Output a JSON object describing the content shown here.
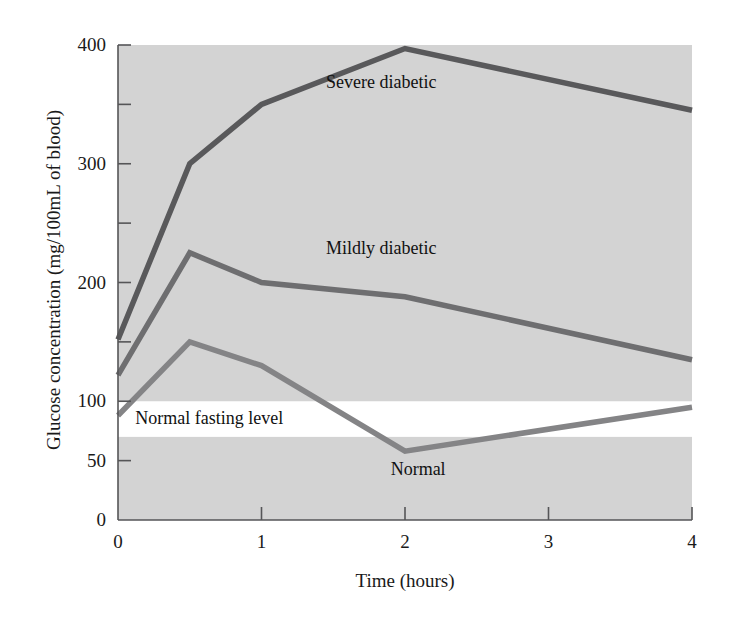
{
  "chart_data": {
    "type": "line",
    "title": "",
    "subtitle": "",
    "xlabel": "Time (hours)",
    "ylabel": "Glucose concentration (mg/100mL of blood)",
    "xlim": [
      0,
      4
    ],
    "ylim": [
      0,
      400
    ],
    "grid": false,
    "legend_position": "inline-annotations",
    "x_ticks": [
      0,
      1,
      2,
      3,
      4
    ],
    "x_tick_labels": [
      "0",
      "1",
      "2",
      "3",
      "4"
    ],
    "y_ticks": [
      0,
      50,
      100,
      150,
      200,
      250,
      300,
      350,
      400
    ],
    "y_tick_labels": [
      "0",
      "50",
      "100",
      "",
      "200",
      "",
      "300",
      "",
      "400"
    ],
    "y_major_labeled": [
      "0",
      "50",
      "100",
      "200",
      "300",
      "400"
    ],
    "series": [
      {
        "name": "Severe diabetic",
        "color": "#59595b",
        "x": [
          0,
          0.5,
          1,
          2,
          4
        ],
        "values": [
          152,
          300,
          350,
          397,
          345
        ],
        "label_x": 1.45,
        "label_y": 368
      },
      {
        "name": "Mildly diabetic",
        "color": "#6e6e70",
        "x": [
          0,
          0.5,
          1,
          2,
          4
        ],
        "values": [
          122,
          225,
          200,
          188,
          135
        ],
        "label_x": 1.45,
        "label_y": 228
      },
      {
        "name": "Normal",
        "color": "#848486",
        "x": [
          0,
          0.5,
          1,
          2,
          4
        ],
        "values": [
          88,
          150,
          130,
          58,
          95
        ],
        "label_x": 1.9,
        "label_y": 42
      }
    ],
    "bands": [
      {
        "name": "Normal fasting level",
        "y_from": 70,
        "y_to": 100,
        "color": "#ffffff",
        "label": "Normal fasting level",
        "label_x": 0.12,
        "label_y": 85
      }
    ],
    "plot_background": "#d3d3d3",
    "axis_color": "#555557",
    "page_background": "#ffffff"
  },
  "annotations": {
    "severe_diabetic": "Severe diabetic",
    "mildly_diabetic": "Mildly diabetic",
    "normal": "Normal",
    "normal_fasting_level": "Normal fasting level"
  },
  "axes": {
    "y_title": "Glucose concentration (mg/100mL of blood)",
    "x_title": "Time (hours)",
    "y_labels": [
      "400",
      "300",
      "200",
      "100",
      "50",
      "0"
    ],
    "x_labels": [
      "0",
      "1",
      "2",
      "3",
      "4"
    ]
  }
}
